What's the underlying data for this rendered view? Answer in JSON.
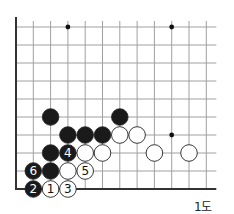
{
  "diagram": {
    "caption": "1도",
    "grid": {
      "origin_x": 16,
      "origin_y": 189,
      "spacing_x": 17.3,
      "spacing_y": 18,
      "cols": 12,
      "rows": 10,
      "open_right_extend": 10,
      "open_top_extend": 0,
      "line_color": "#a0a0a0",
      "edge_color": "#333333"
    },
    "hoshi": [
      {
        "col": 3,
        "row": 9
      },
      {
        "col": 9,
        "row": 9
      },
      {
        "col": 9,
        "row": 3
      }
    ],
    "stones": [
      {
        "color": "black",
        "col": 2,
        "row": 4
      },
      {
        "color": "black",
        "col": 6,
        "row": 4
      },
      {
        "color": "black",
        "col": 3,
        "row": 3
      },
      {
        "color": "black",
        "col": 4,
        "row": 3
      },
      {
        "color": "black",
        "col": 5,
        "row": 3
      },
      {
        "color": "white",
        "col": 6,
        "row": 3
      },
      {
        "color": "white",
        "col": 7,
        "row": 3
      },
      {
        "color": "black",
        "col": 2,
        "row": 2
      },
      {
        "color": "black",
        "col": 3,
        "row": 2,
        "label": "4"
      },
      {
        "color": "white",
        "col": 4,
        "row": 2
      },
      {
        "color": "white",
        "col": 5,
        "row": 2
      },
      {
        "color": "white",
        "col": 8,
        "row": 2
      },
      {
        "color": "white",
        "col": 10,
        "row": 2
      },
      {
        "color": "black",
        "col": 1,
        "row": 1,
        "label": "6"
      },
      {
        "color": "black",
        "col": 2,
        "row": 1
      },
      {
        "color": "white",
        "col": 3,
        "row": 1
      },
      {
        "color": "white",
        "col": 4,
        "row": 1,
        "label": "5"
      },
      {
        "color": "black",
        "col": 1,
        "row": 0,
        "label": "2"
      },
      {
        "color": "white",
        "col": 2,
        "row": 0,
        "label": "1"
      },
      {
        "color": "white",
        "col": 3,
        "row": 0,
        "label": "3"
      }
    ]
  }
}
